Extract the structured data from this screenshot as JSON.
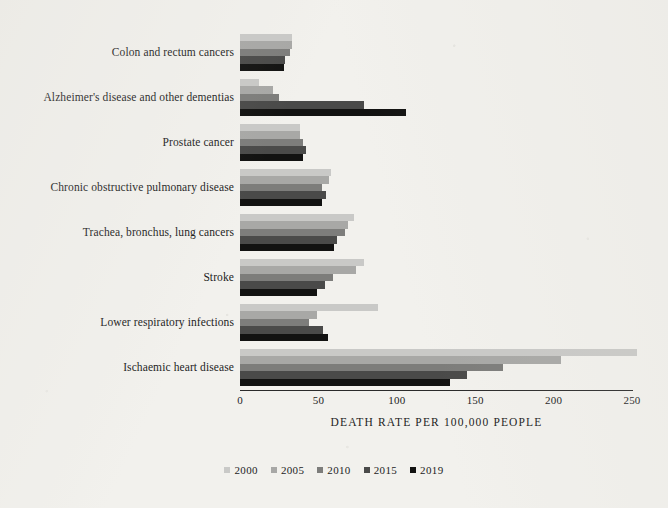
{
  "chart_data": {
    "type": "bar",
    "orientation": "horizontal",
    "title": "",
    "subtitle": "",
    "xlabel": "DEATH RATE PER 100,000 PEOPLE",
    "ylabel": "",
    "xlim": [
      0,
      250
    ],
    "xticks": [
      0,
      50,
      100,
      150,
      200,
      250
    ],
    "xtick_labels": [
      "0",
      "50",
      "100",
      "150",
      "200",
      "250"
    ],
    "grid": false,
    "legend_position": "bottom",
    "categories": [
      "Colon and rectum cancers",
      "Alzheimer's disease and other dementias",
      "Prostate cancer",
      "Chronic obstructive pulmonary disease",
      "Trachea, bronchus, lung cancers",
      "Stroke",
      "Lower respiratory infections",
      "Ischaemic heart disease"
    ],
    "series": [
      {
        "name": "2000",
        "color": "#c9c9c7",
        "values": [
          33,
          12,
          38,
          58,
          73,
          79,
          88,
          253
        ]
      },
      {
        "name": "2005",
        "color": "#a8a8a6",
        "values": [
          33,
          21,
          38,
          57,
          69,
          74,
          49,
          205
        ]
      },
      {
        "name": "2010",
        "color": "#7d7d7b",
        "values": [
          32,
          25,
          40,
          52,
          67,
          59,
          44,
          168
        ]
      },
      {
        "name": "2015",
        "color": "#4a4a49",
        "values": [
          29,
          79,
          42,
          55,
          62,
          54,
          53,
          145
        ]
      },
      {
        "name": "2019",
        "color": "#121211",
        "values": [
          28,
          106,
          40,
          52,
          60,
          49,
          56,
          134
        ]
      }
    ]
  },
  "axis": {
    "x_title": "DEATH RATE PER 100,000 PEOPLE",
    "tick_labels": [
      "0",
      "50",
      "100",
      "150",
      "200",
      "250"
    ]
  },
  "legend": {
    "entries": [
      {
        "label": "2000",
        "color": "#c9c9c7"
      },
      {
        "label": "2005",
        "color": "#a8a8a6"
      },
      {
        "label": "2010",
        "color": "#7d7d7b"
      },
      {
        "label": "2015",
        "color": "#4a4a49"
      },
      {
        "label": "2019",
        "color": "#121211"
      }
    ]
  }
}
